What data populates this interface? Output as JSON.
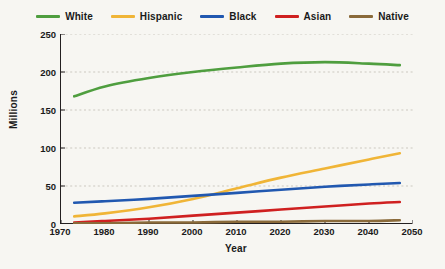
{
  "chart_data": {
    "type": "line",
    "title": "",
    "xlabel": "Year",
    "ylabel": "Millions",
    "xlim": [
      1970,
      2050
    ],
    "ylim": [
      0,
      250
    ],
    "x_ticks": [
      1970,
      1980,
      1990,
      2000,
      2010,
      2020,
      2030,
      2040,
      2050
    ],
    "y_ticks": [
      0,
      50,
      100,
      150,
      200,
      250
    ],
    "grid": true,
    "legend_position": "top",
    "x": [
      1973,
      1980,
      1990,
      2000,
      2010,
      2020,
      2030,
      2040,
      2047
    ],
    "series": [
      {
        "name": "White",
        "color": "#4f9e3f",
        "values": [
          168,
          181,
          192,
          200,
          206,
          211,
          213,
          211,
          209
        ]
      },
      {
        "name": "Hispanic",
        "color": "#f0b537",
        "values": [
          10,
          14,
          22,
          33,
          47,
          61,
          73,
          85,
          93
        ]
      },
      {
        "name": "Black",
        "color": "#2158b0",
        "values": [
          28,
          30,
          33,
          37,
          41,
          45,
          49,
          52,
          54
        ]
      },
      {
        "name": "Asian",
        "color": "#cf2020",
        "values": [
          2,
          4,
          7,
          11,
          15,
          19,
          23,
          27,
          29
        ]
      },
      {
        "name": "Native",
        "color": "#8a6a3a",
        "values": [
          1,
          1,
          2,
          2,
          3,
          3,
          4,
          4,
          5
        ]
      }
    ]
  },
  "legend": {
    "items": [
      {
        "label": "White",
        "color": "#4f9e3f"
      },
      {
        "label": "Hispanic",
        "color": "#f0b537"
      },
      {
        "label": "Black",
        "color": "#2158b0"
      },
      {
        "label": "Asian",
        "color": "#cf2020"
      },
      {
        "label": "Native",
        "color": "#8a6a3a"
      }
    ]
  },
  "axes": {
    "y_title": "Millions",
    "x_title": "Year",
    "y_tick_labels": [
      "250",
      "200",
      "150",
      "100",
      "50",
      "0"
    ],
    "x_tick_labels": [
      "1970",
      "1980",
      "1990",
      "2000",
      "2010",
      "2020",
      "2030",
      "2040",
      "2050"
    ]
  }
}
